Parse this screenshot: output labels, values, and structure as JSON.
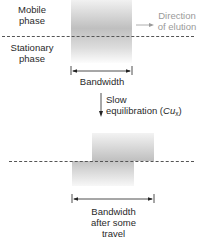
{
  "diagram": {
    "top": {
      "mobile_phase_line1": "Mobile",
      "mobile_phase_line2": "phase",
      "stationary_phase_line1": "Stationary",
      "stationary_phase_line2": "phase",
      "direction_line1": "Direction",
      "direction_line2": "of elution",
      "bandwidth_label": "Bandwidth"
    },
    "transition": {
      "line1": "Slow",
      "line2_prefix": "equilibration (",
      "symbol": "Cu",
      "subscript": "x",
      "line2_suffix": ")"
    },
    "bottom": {
      "bandwidth_line1": "Bandwidth",
      "bandwidth_line2": "after some",
      "bandwidth_line3": "travel"
    },
    "colors": {
      "band_gray": "#b0b0b0",
      "dash_line": "#555555",
      "direction_text": "#9a9a9a",
      "text": "#2a2a2a"
    }
  }
}
